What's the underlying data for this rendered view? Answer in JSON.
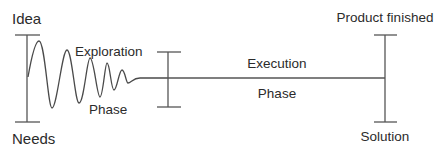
{
  "diagram": {
    "labels": {
      "start_top": "Idea",
      "start_bottom": "Needs",
      "exploration_top": "Exploration",
      "exploration_bottom": "Phase",
      "execution_top": "Execution",
      "execution_bottom": "Phase",
      "end_top": "Product finished",
      "end_bottom": "Solution"
    },
    "colors": {
      "line": "#555555",
      "wave": "#4a4a4a",
      "text": "#2b2b2b",
      "background": "#ffffff"
    },
    "markers": [
      {
        "name": "start",
        "x": 27,
        "top": 35,
        "bottom": 122
      },
      {
        "name": "phase-boundary",
        "x": 168,
        "top": 52,
        "bottom": 107
      },
      {
        "name": "end",
        "x": 385,
        "top": 35,
        "bottom": 122
      }
    ]
  }
}
